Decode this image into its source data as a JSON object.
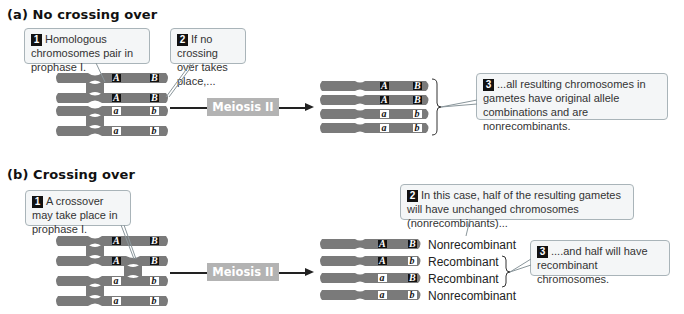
{
  "panel_a": {
    "title": "(a)  No crossing over",
    "callout1": {
      "num": "1",
      "text": "Homologous chromosomes pair in prophase I."
    },
    "callout2": {
      "num": "2",
      "text": "If no crossing over takes place,..."
    },
    "callout3": {
      "num": "3",
      "text": "...all resulting chromosomes in gametes have original allele combinations and are nonrecombinants."
    },
    "process_label": "Meiosis II",
    "chromosomes_left": [
      {
        "allele1": "A",
        "allele2": "B"
      },
      {
        "allele1": "A",
        "allele2": "B"
      },
      {
        "allele1": "a",
        "allele2": "b"
      },
      {
        "allele1": "a",
        "allele2": "b"
      }
    ],
    "gametes": [
      {
        "allele1": "A",
        "allele2": "B"
      },
      {
        "allele1": "A",
        "allele2": "B"
      },
      {
        "allele1": "a",
        "allele2": "b"
      },
      {
        "allele1": "a",
        "allele2": "b"
      }
    ]
  },
  "panel_b": {
    "title": "(b)  Crossing over",
    "callout1": {
      "num": "1",
      "text": "A crossover may take place in prophase I."
    },
    "callout2": {
      "num": "2",
      "text": "In this case, half of the resulting gametes will have unchanged chromosomes (nonrecombinants)..."
    },
    "callout3": {
      "num": "3",
      "text": "....and half will have recombinant chromosomes."
    },
    "process_label": "Meiosis II",
    "chromosomes_left": [
      {
        "allele1": "A",
        "allele2": "B"
      },
      {
        "allele1": "A",
        "allele2": "B"
      },
      {
        "allele1": "a",
        "allele2": "b"
      },
      {
        "allele1": "a",
        "allele2": "b"
      }
    ],
    "gametes": [
      {
        "allele1": "A",
        "allele2": "B",
        "type": "Nonrecombinant"
      },
      {
        "allele1": "A",
        "allele2": "b",
        "type": "Recombinant"
      },
      {
        "allele1": "a",
        "allele2": "B",
        "type": "Recombinant"
      },
      {
        "allele1": "a",
        "allele2": "b",
        "type": "Nonrecombinant"
      }
    ]
  },
  "colors": {
    "chromosome": "#7a7a7a",
    "dominant_allele_bg": "#111111",
    "recessive_allele_bg": "#ffffff",
    "meiosis_box": "#b3b3b3",
    "callout_bg": "#f4f6f7",
    "callout_border": "#a9b4b9"
  }
}
